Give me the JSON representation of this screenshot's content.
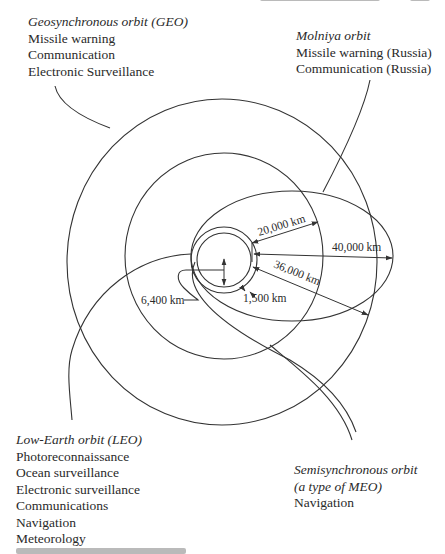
{
  "figure": {
    "orbits": [
      {
        "id": "geo",
        "title": "Geosynchronous orbit (GEO)",
        "missions": [
          "Missile warning",
          "Communication",
          "Electronic Surveillance"
        ]
      },
      {
        "id": "molniya",
        "title": "Molniya orbit",
        "missions": [
          "Missile warning (Russia)",
          "Communication (Russia)"
        ]
      },
      {
        "id": "leo",
        "title": "Low-Earth orbit (LEO)",
        "missions": [
          "Photoreconnaissance",
          "Ocean surveillance",
          "Electronic surveillance",
          "Communications",
          "Navigation",
          "Meteorology"
        ]
      },
      {
        "id": "meo",
        "title_line1": "Semisynchronous orbit",
        "title_line2": "(a type of MEO)",
        "missions": [
          "Navigation"
        ]
      }
    ],
    "dimensions": {
      "earth_radius": "6,400 km",
      "leo_altitude": "1,500 km",
      "meo_altitude": "20,000 km",
      "geo_altitude": "36,000 km",
      "molniya_apogee": "40,000 km"
    },
    "colors": {
      "line": "#333333",
      "text": "#2a2a2a",
      "background": "#ffffff"
    }
  }
}
